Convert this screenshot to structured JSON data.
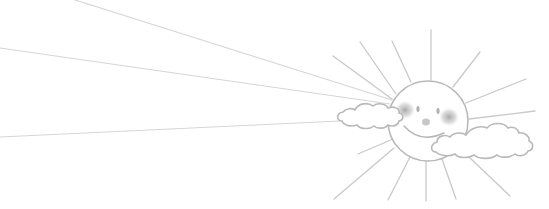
{
  "illustration": {
    "subject": "smiling sun with clouds",
    "colors": {
      "background": "#ffffff",
      "line": "#b9b9b9",
      "ray": "#c9c9c9",
      "ray_faint": "#d6d6d6",
      "blush": "#9a9a9a",
      "feature": "#b0b0b0"
    },
    "sun": {
      "cx": 428,
      "cy": 121,
      "r": 40
    },
    "long_rays": [
      {
        "x1": 75,
        "y1": 0,
        "x2": 392,
        "y2": 100
      },
      {
        "x1": 0,
        "y1": 48,
        "x2": 390,
        "y2": 104
      },
      {
        "x1": 0,
        "y1": 137,
        "x2": 340,
        "y2": 121
      }
    ],
    "short_rays": [
      {
        "x1": 392,
        "y1": 41,
        "x2": 411,
        "y2": 82
      },
      {
        "x1": 431,
        "y1": 30,
        "x2": 431,
        "y2": 80
      },
      {
        "x1": 480,
        "y1": 52,
        "x2": 453,
        "y2": 87
      },
      {
        "x1": 526,
        "y1": 79,
        "x2": 466,
        "y2": 103
      },
      {
        "x1": 535,
        "y1": 111,
        "x2": 469,
        "y2": 119
      },
      {
        "x1": 360,
        "y1": 42,
        "x2": 396,
        "y2": 94
      },
      {
        "x1": 333,
        "y1": 56,
        "x2": 392,
        "y2": 99
      },
      {
        "x1": 358,
        "y1": 154,
        "x2": 393,
        "y2": 139
      },
      {
        "x1": 334,
        "y1": 199,
        "x2": 394,
        "y2": 148
      },
      {
        "x1": 388,
        "y1": 200,
        "x2": 410,
        "y2": 157
      },
      {
        "x1": 426,
        "y1": 201,
        "x2": 426,
        "y2": 161
      },
      {
        "x1": 456,
        "y1": 199,
        "x2": 442,
        "y2": 159
      },
      {
        "x1": 510,
        "y1": 196,
        "x2": 470,
        "y2": 158
      }
    ]
  }
}
